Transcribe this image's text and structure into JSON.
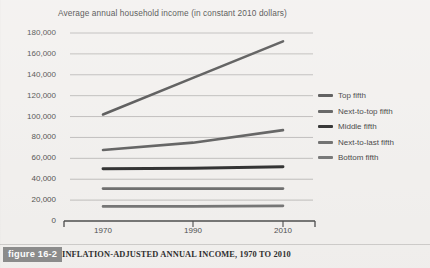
{
  "figure": {
    "badge_label": "figure 16-2",
    "caption": "INFLATION-ADJUSTED ANNUAL INCOME, 1970 TO 2010",
    "badge_color": "#8d8d8d",
    "background_color": "#f3f1ef"
  },
  "chart_data": {
    "type": "line",
    "title": "Average annual household income (in constant 2010 dollars)",
    "xlabel": "",
    "ylabel": "",
    "x": [
      1970,
      1990,
      2010
    ],
    "xtick_labels": [
      "1970",
      "1990",
      "2010"
    ],
    "ytick_labels": [
      "0",
      "20,000",
      "40,000",
      "60,000",
      "80,000",
      "100,000",
      "120,000",
      "140,000",
      "160,000",
      "180,000"
    ],
    "yticks": [
      0,
      20000,
      40000,
      60000,
      80000,
      100000,
      120000,
      140000,
      160000,
      180000
    ],
    "ylim": [
      0,
      180000
    ],
    "xlim": [
      1970,
      2010
    ],
    "grid": true,
    "legend_position": "right",
    "series": [
      {
        "name": "Top fifth",
        "values": [
          102000,
          137000,
          172000
        ],
        "color": "#555555",
        "width": 2.6
      },
      {
        "name": "Next-to-top fifth",
        "values": [
          68000,
          75000,
          87000
        ],
        "color": "#5e5e5e",
        "width": 2.6
      },
      {
        "name": "Middle fifth",
        "values": [
          50000,
          50500,
          52000
        ],
        "color": "#2b2b2b",
        "width": 2.9
      },
      {
        "name": "Next-to-last fifth",
        "values": [
          31000,
          31000,
          31000
        ],
        "color": "#6b6b6b",
        "width": 2.6
      },
      {
        "name": "Bottom fifth",
        "values": [
          14000,
          14000,
          14500
        ],
        "color": "#737373",
        "width": 2.6
      }
    ]
  },
  "axis": {
    "line_color": "#4a4a4a",
    "grid_color": "#b9b7b5"
  }
}
